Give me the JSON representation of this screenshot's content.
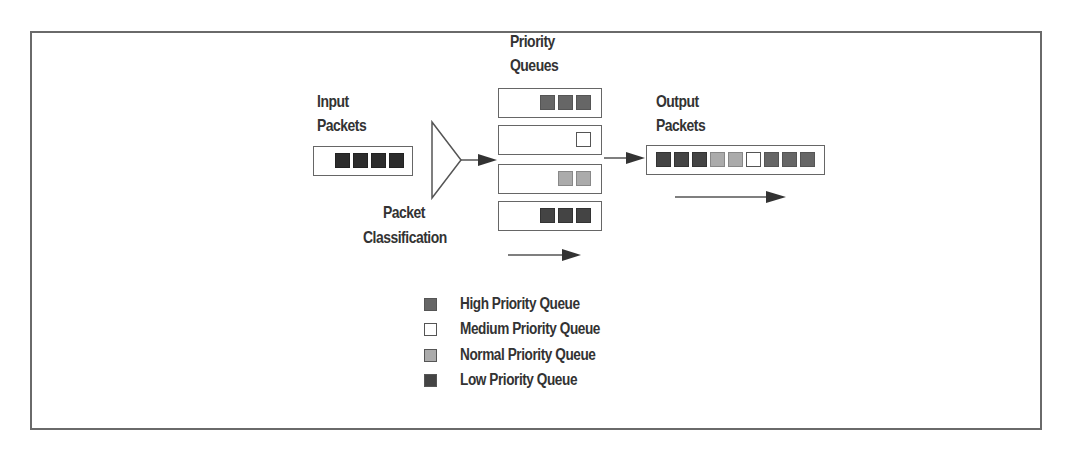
{
  "diagram": {
    "type": "priority-queuing-flow",
    "labels": {
      "input": [
        "Input",
        "Packets"
      ],
      "classifier": [
        "Packet",
        "Classification"
      ],
      "queues": [
        "Priority",
        "Queues"
      ],
      "output": [
        "Output",
        "Packets"
      ]
    },
    "colors": {
      "input": "#2c2c2c",
      "high": "#666666",
      "medium": "#ffffff",
      "normal": "#ababab",
      "low": "#444444",
      "line": "#555555",
      "text": "#333333"
    },
    "input_packets": [
      "input",
      "input",
      "input",
      "input"
    ],
    "queues": [
      {
        "name": "High Priority Queue",
        "packets": [
          "high",
          "high",
          "high"
        ]
      },
      {
        "name": "Medium Priority Queue",
        "packets": [
          "medium"
        ]
      },
      {
        "name": "Normal Priority Queue",
        "packets": [
          "normal",
          "normal"
        ]
      },
      {
        "name": "Low Priority Queue",
        "packets": [
          "low",
          "low",
          "low"
        ]
      }
    ],
    "output_packets": [
      "low",
      "low",
      "low",
      "normal",
      "normal",
      "medium",
      "high",
      "high",
      "high"
    ],
    "legend": [
      {
        "key": "high",
        "label": "High Priority Queue"
      },
      {
        "key": "medium",
        "label": "Medium Priority Queue"
      },
      {
        "key": "normal",
        "label": "Normal Priority Queue"
      },
      {
        "key": "low",
        "label": "Low Priority Queue"
      }
    ]
  }
}
